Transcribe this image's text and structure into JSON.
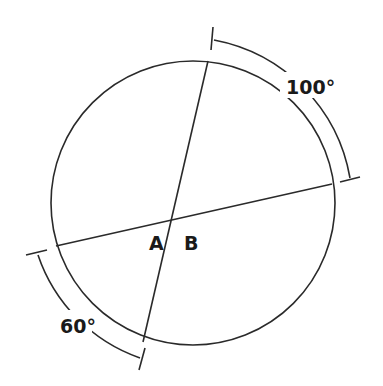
{
  "diagram": {
    "type": "circle-with-intersecting-chords",
    "angle_labels": {
      "a": "A",
      "b": "B"
    },
    "arc_labels": {
      "upper_right": "100°",
      "lower_left": "60°"
    },
    "colors": {
      "stroke": "#2a2a2a",
      "text": "#1a1a1a",
      "background": "#ffffff"
    }
  }
}
